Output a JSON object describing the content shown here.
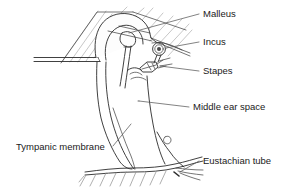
{
  "figure": {
    "background_color": "#ffffff",
    "line_color": "#2b2b2b",
    "hatch_color": "#b9b9b9",
    "leader_color": "#5a5a5a",
    "text_color": "#1a1a1a"
  },
  "labels": [
    {
      "id": "malleus",
      "text": "Malleus",
      "x": 203,
      "y": 17,
      "leader": "M 199 14 L 129 33",
      "anchor": "start"
    },
    {
      "id": "incus",
      "text": "Incus",
      "x": 203,
      "y": 45,
      "leader": "M 199 42 L 160 48",
      "anchor": "start"
    },
    {
      "id": "stapes",
      "text": "Stapes",
      "x": 203,
      "y": 74,
      "leader": "M 199 71 L 152 64",
      "anchor": "start"
    },
    {
      "id": "middle-ear-space",
      "text": "Middle ear space",
      "x": 193,
      "y": 110,
      "leader": "M 189 107 L 139 101",
      "anchor": "start"
    },
    {
      "id": "tympanic-membrane",
      "text": "Tympanic membrane",
      "x": 16,
      "y": 150,
      "leader": "M 113 146 L 131 125",
      "anchor": "start"
    },
    {
      "id": "eustachian-tube",
      "text": "Eustachian tube",
      "x": 203,
      "y": 164,
      "leader": "M 199 161 L 178 169",
      "anchor": "start"
    }
  ],
  "structures": [
    {
      "id": "temporal-bone-hatching",
      "name": "Temporal bone hatching"
    },
    {
      "id": "ear-canal",
      "name": "External auditory canal"
    },
    {
      "id": "malleus-bone",
      "name": "Malleus ossicle"
    },
    {
      "id": "incus-bone",
      "name": "Incus ossicle"
    },
    {
      "id": "stapes-bone",
      "name": "Stapes ossicle"
    },
    {
      "id": "tympanic-membrane-shape",
      "name": "Tympanic membrane"
    },
    {
      "id": "middle-ear-cavity",
      "name": "Middle ear cavity"
    },
    {
      "id": "eustachian-tube-shape",
      "name": "Eustachian tube"
    }
  ]
}
